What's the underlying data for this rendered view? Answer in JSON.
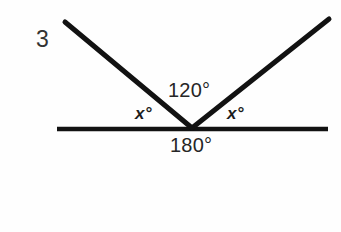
{
  "figure": {
    "problem_number": "3",
    "background_color": "#fefefe",
    "stroke_color": "#121212",
    "labels": {
      "interior_angle": "120°",
      "straight_angle": "180°",
      "x_left": "x°",
      "x_right": "x°"
    },
    "geometry": {
      "vertex": {
        "x": 192,
        "y": 128
      },
      "baseline": {
        "x1": 57,
        "y1": 129,
        "x2": 328,
        "y2": 129,
        "width": 4.5
      },
      "ray_left": {
        "x1": 65,
        "y1": 22,
        "x2": 192,
        "y2": 128,
        "width": 5
      },
      "ray_right": {
        "x1": 192,
        "y1": 128,
        "x2": 329,
        "y2": 19,
        "width": 5
      }
    }
  }
}
